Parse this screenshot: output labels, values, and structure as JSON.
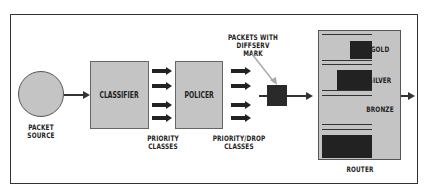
{
  "diagram": {
    "nodes": {
      "source": {
        "label_line1": "PACKET",
        "label_line2": "SOURCE"
      },
      "classifier": {
        "label": "CLASSIFIER"
      },
      "policer": {
        "label": "POLICER"
      },
      "router": {
        "label": "ROUTER"
      }
    },
    "annotations": {
      "priority_classes": {
        "line1": "PRIORITY",
        "line2": "CLASSES"
      },
      "priority_drop_classes": {
        "line1": "PRIORITY/DROP",
        "line2": "CLASSES"
      },
      "packets_mark": {
        "line1": "PACKETS WITH",
        "line2": "DIFFSERV MARK"
      }
    },
    "queues": [
      {
        "label": "GOLD"
      },
      {
        "label": "SILVER"
      },
      {
        "label": "BRONZE"
      },
      {
        "label": ""
      }
    ]
  }
}
